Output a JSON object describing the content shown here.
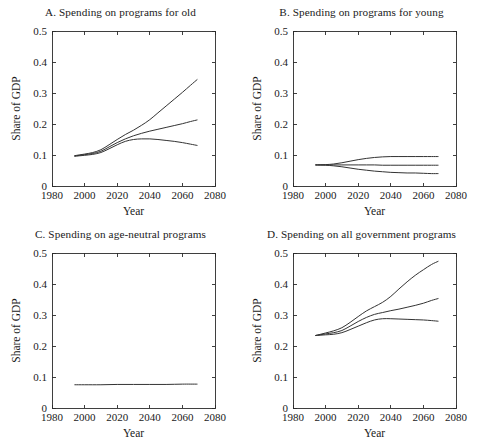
{
  "figure": {
    "width": 483,
    "height": 444,
    "background": "#ffffff",
    "line_color": "#333333",
    "axis_color": "#2a2a2a"
  },
  "chart_data": [
    {
      "id": "panel-a",
      "type": "line",
      "title": "A. Spending on programs for old",
      "xlabel": "Year",
      "ylabel": "Share of GDP",
      "xlim": [
        1980,
        2080
      ],
      "ylim": [
        0,
        0.5
      ],
      "xticks": [
        1980,
        2000,
        2020,
        2040,
        2060,
        2080
      ],
      "xtick_labels": [
        "1980",
        "2000",
        "2020",
        "2040",
        "2060",
        "2080"
      ],
      "yticks": [
        0,
        0.1,
        0.2,
        0.3,
        0.4,
        0.5
      ],
      "ytick_labels": [
        "0",
        "0.1",
        "0.2",
        "0.3",
        "0.4",
        "0.5"
      ],
      "grid": false,
      "legend": "none",
      "x": [
        1994,
        2000,
        2005,
        2010,
        2015,
        2020,
        2025,
        2030,
        2035,
        2040,
        2045,
        2050,
        2055,
        2060,
        2065,
        2069
      ],
      "series": [
        {
          "name": "high",
          "values": [
            0.098,
            0.103,
            0.108,
            0.117,
            0.133,
            0.15,
            0.166,
            0.18,
            0.196,
            0.214,
            0.236,
            0.258,
            0.28,
            0.302,
            0.325,
            0.343
          ]
        },
        {
          "name": "middle",
          "values": [
            0.097,
            0.101,
            0.105,
            0.112,
            0.126,
            0.14,
            0.152,
            0.162,
            0.17,
            0.177,
            0.183,
            0.189,
            0.195,
            0.201,
            0.208,
            0.213
          ]
        },
        {
          "name": "low",
          "values": [
            0.096,
            0.099,
            0.102,
            0.108,
            0.12,
            0.133,
            0.144,
            0.15,
            0.152,
            0.152,
            0.15,
            0.147,
            0.144,
            0.14,
            0.135,
            0.131
          ]
        }
      ]
    },
    {
      "id": "panel-b",
      "type": "line",
      "title": "B. Spending on programs for young",
      "xlabel": "Year",
      "ylabel": "Share of GDP",
      "xlim": [
        1980,
        2080
      ],
      "ylim": [
        0,
        0.5
      ],
      "xticks": [
        1980,
        2000,
        2020,
        2040,
        2060,
        2080
      ],
      "xtick_labels": [
        "1980",
        "2000",
        "2020",
        "2040",
        "2060",
        "2080"
      ],
      "yticks": [
        0,
        0.1,
        0.2,
        0.3,
        0.4,
        0.5
      ],
      "ytick_labels": [
        "0",
        "0.1",
        "0.2",
        "0.3",
        "0.4",
        "0.5"
      ],
      "grid": false,
      "legend": "none",
      "x": [
        1994,
        2000,
        2005,
        2010,
        2015,
        2020,
        2025,
        2030,
        2035,
        2040,
        2045,
        2050,
        2055,
        2060,
        2065,
        2069
      ],
      "series": [
        {
          "name": "high",
          "values": [
            0.068,
            0.069,
            0.071,
            0.075,
            0.08,
            0.085,
            0.089,
            0.092,
            0.094,
            0.095,
            0.095,
            0.095,
            0.095,
            0.095,
            0.095,
            0.095
          ]
        },
        {
          "name": "middle",
          "values": [
            0.068,
            0.068,
            0.068,
            0.068,
            0.068,
            0.068,
            0.068,
            0.068,
            0.067,
            0.067,
            0.067,
            0.067,
            0.067,
            0.067,
            0.067,
            0.067
          ]
        },
        {
          "name": "low",
          "values": [
            0.068,
            0.067,
            0.065,
            0.062,
            0.058,
            0.054,
            0.051,
            0.048,
            0.046,
            0.044,
            0.043,
            0.042,
            0.042,
            0.041,
            0.04,
            0.04
          ]
        }
      ]
    },
    {
      "id": "panel-c",
      "type": "line",
      "title": "C. Spending on age-neutral programs",
      "xlabel": "Year",
      "ylabel": "Share of GDP",
      "xlim": [
        1980,
        2080
      ],
      "ylim": [
        0,
        0.5
      ],
      "xticks": [
        1980,
        2000,
        2020,
        2040,
        2060,
        2080
      ],
      "xtick_labels": [
        "1980",
        "2000",
        "2020",
        "2040",
        "2060",
        "2080"
      ],
      "yticks": [
        0,
        0.1,
        0.2,
        0.3,
        0.4,
        0.5
      ],
      "ytick_labels": [
        "0",
        "0.1",
        "0.2",
        "0.3",
        "0.4",
        "0.5"
      ],
      "grid": false,
      "legend": "none",
      "x": [
        1994,
        2000,
        2010,
        2020,
        2030,
        2040,
        2050,
        2060,
        2069
      ],
      "series": [
        {
          "name": "age-neutral",
          "values": [
            0.075,
            0.075,
            0.075,
            0.076,
            0.076,
            0.076,
            0.076,
            0.077,
            0.077
          ]
        }
      ]
    },
    {
      "id": "panel-d",
      "type": "line",
      "title": "D. Spending on all government programs",
      "xlabel": "Year",
      "ylabel": "Share of GDP",
      "xlim": [
        1980,
        2080
      ],
      "ylim": [
        0,
        0.5
      ],
      "xticks": [
        1980,
        2000,
        2020,
        2040,
        2060,
        2080
      ],
      "xtick_labels": [
        "1980",
        "2000",
        "2020",
        "2040",
        "2060",
        "2080"
      ],
      "yticks": [
        0,
        0.1,
        0.2,
        0.3,
        0.4,
        0.5
      ],
      "ytick_labels": [
        "0",
        "0.1",
        "0.2",
        "0.3",
        "0.4",
        "0.5"
      ],
      "grid": false,
      "legend": "none",
      "x": [
        1994,
        2000,
        2005,
        2010,
        2015,
        2020,
        2025,
        2030,
        2035,
        2040,
        2045,
        2050,
        2055,
        2060,
        2065,
        2069
      ],
      "series": [
        {
          "name": "high",
          "values": [
            0.234,
            0.242,
            0.249,
            0.259,
            0.276,
            0.295,
            0.313,
            0.327,
            0.341,
            0.36,
            0.384,
            0.407,
            0.428,
            0.446,
            0.463,
            0.473
          ]
        },
        {
          "name": "middle",
          "values": [
            0.234,
            0.239,
            0.243,
            0.25,
            0.264,
            0.279,
            0.292,
            0.302,
            0.308,
            0.314,
            0.319,
            0.325,
            0.331,
            0.338,
            0.347,
            0.353
          ]
        },
        {
          "name": "low",
          "values": [
            0.234,
            0.236,
            0.238,
            0.243,
            0.253,
            0.264,
            0.275,
            0.284,
            0.288,
            0.288,
            0.287,
            0.286,
            0.285,
            0.284,
            0.282,
            0.28
          ]
        }
      ]
    }
  ]
}
